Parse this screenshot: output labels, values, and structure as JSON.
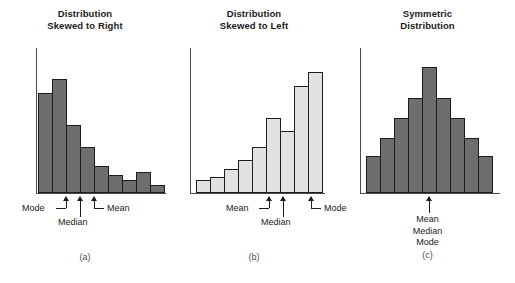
{
  "figure": {
    "panels": [
      {
        "id": "a",
        "caption": "(a)",
        "title_line1": "Distribution",
        "title_line2": "Skewed to Right",
        "bar_style": "dark",
        "labels": {
          "mode": "Mode",
          "median": "Median",
          "mean": "Mean"
        }
      },
      {
        "id": "b",
        "caption": "(b)",
        "title_line1": "Distribution",
        "title_line2": "Skewed to Left",
        "bar_style": "light",
        "labels": {
          "mean": "Mean",
          "median": "Median",
          "mode": "Mode"
        }
      },
      {
        "id": "c",
        "caption": "(c)",
        "title_line1": "Symmetric",
        "title_line2": "Distribution",
        "bar_style": "dark",
        "labels": {
          "mean": "Mean",
          "median": "Median",
          "mode": "Mode"
        }
      }
    ],
    "colors": {
      "bar_dark": "#6e6e6e",
      "bar_light": "#e2e2e2",
      "bar_outline": "#1c1c1c",
      "axis": "#4a4a4a",
      "text": "#1a1a1a",
      "caption": "#4d4d4d",
      "background": "#ffffff"
    }
  },
  "chart_data": [
    {
      "type": "bar",
      "title": "Distribution Skewed to Right",
      "panel": "(a)",
      "xlabel": "",
      "ylabel": "",
      "grid": false,
      "legend": "none",
      "categories": [
        "1",
        "2",
        "3",
        "4",
        "5",
        "6",
        "7",
        "8",
        "9"
      ],
      "values": [
        97,
        110,
        66,
        44,
        26,
        17,
        13,
        20,
        8
      ],
      "ylim": [
        0,
        140
      ],
      "annotations": [
        {
          "label": "Mode",
          "category_index": 1,
          "marker": "arrow"
        },
        {
          "label": "Median",
          "category_index": 2,
          "marker": "arrow"
        },
        {
          "label": "Mean",
          "category_index": 3,
          "marker": "arrow"
        }
      ]
    },
    {
      "type": "bar",
      "title": "Distribution Skewed to Left",
      "panel": "(b)",
      "xlabel": "",
      "ylabel": "",
      "grid": false,
      "legend": "none",
      "categories": [
        "1",
        "2",
        "3",
        "4",
        "5",
        "6",
        "7",
        "8",
        "9"
      ],
      "values": [
        13,
        15,
        23,
        32,
        44,
        72,
        60,
        103,
        117
      ],
      "ylim": [
        0,
        140
      ],
      "annotations": [
        {
          "label": "Mean",
          "category_index": 5,
          "marker": "arrow"
        },
        {
          "label": "Median",
          "category_index": 6,
          "marker": "arrow"
        },
        {
          "label": "Mode",
          "category_index": 8,
          "marker": "arrow"
        }
      ]
    },
    {
      "type": "bar",
      "title": "Symmetric Distribution",
      "panel": "(c)",
      "xlabel": "",
      "ylabel": "",
      "grid": false,
      "legend": "none",
      "categories": [
        "1",
        "2",
        "3",
        "4",
        "5",
        "6",
        "7",
        "8",
        "9"
      ],
      "values": [
        36,
        53,
        72,
        92,
        122,
        92,
        72,
        53,
        36
      ],
      "ylim": [
        0,
        140
      ],
      "annotations": [
        {
          "label": "Mean Median Mode",
          "category_index": 4,
          "marker": "arrow"
        }
      ]
    }
  ]
}
